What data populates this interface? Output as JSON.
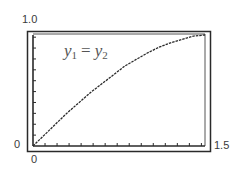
{
  "chart_data": {
    "type": "line",
    "title": "",
    "xlabel": "",
    "ylabel": "",
    "xlim": [
      0,
      1.5
    ],
    "ylim": [
      0,
      1.0
    ],
    "x_tick_labels": [
      "0",
      "1.5"
    ],
    "y_tick_labels": [
      "0",
      "1.0"
    ],
    "x_tick_count": 14,
    "y_tick_count": 10,
    "grid": false,
    "legend": null,
    "annotations": [
      {
        "text": "y1 = y2",
        "x": 0.45,
        "y": 0.82
      }
    ],
    "series": [
      {
        "name": "y1 = y2",
        "x": [
          0,
          0.1,
          0.2,
          0.3,
          0.4,
          0.5,
          0.6,
          0.7,
          0.8,
          0.9,
          1.0,
          1.1,
          1.2,
          1.3,
          1.4,
          1.5
        ],
        "values": [
          0,
          0.1,
          0.2,
          0.3,
          0.39,
          0.48,
          0.56,
          0.64,
          0.72,
          0.78,
          0.84,
          0.89,
          0.93,
          0.96,
          0.99,
          1.0
        ]
      }
    ]
  },
  "labels": {
    "y_max": "1.0",
    "y_min": "0",
    "x_min": "0",
    "x_max": "1.5",
    "curve_var": "y",
    "curve_sub1": "1",
    "curve_eq": "=",
    "curve_sub2": "2"
  },
  "colors": {
    "frame": "#2a2a2a",
    "curve": "#2a2a2a",
    "text": "#3a3a3a"
  }
}
